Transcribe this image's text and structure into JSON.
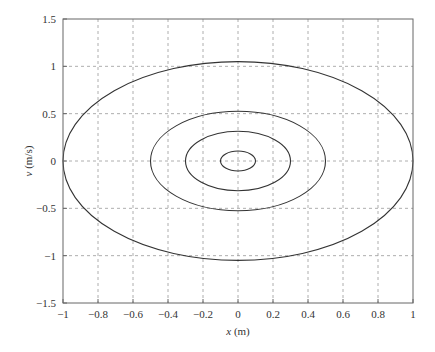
{
  "chart_data": {
    "type": "line",
    "title": "",
    "xlabel": "x (m)",
    "ylabel": "v (m/s)",
    "xlim": [
      -1,
      1
    ],
    "ylim": [
      -1.5,
      1.5
    ],
    "grid": true,
    "legend": null,
    "x_ticks": [
      -1,
      -0.8,
      -0.6,
      -0.4,
      -0.2,
      0,
      0.2,
      0.4,
      0.6,
      0.8,
      1
    ],
    "x_tick_labels": [
      "−1",
      "−0.8",
      "−0.6",
      "−0.4",
      "−0.2",
      "0",
      "0.2",
      "0.4",
      "0.6",
      "0.8",
      "1"
    ],
    "y_ticks": [
      -1.5,
      -1,
      -0.5,
      0,
      0.5,
      1,
      1.5
    ],
    "y_tick_labels": [
      "−1.5",
      "−1",
      "−0.5",
      "0",
      "0.5",
      "1",
      "1.5"
    ],
    "series": [
      {
        "name": "orbit-1",
        "shape": "ellipse",
        "center": [
          0,
          0
        ],
        "x_radius": 0.1,
        "v_radius": 0.105
      },
      {
        "name": "orbit-2",
        "shape": "ellipse",
        "center": [
          0,
          0
        ],
        "x_radius": 0.3,
        "v_radius": 0.315
      },
      {
        "name": "orbit-3",
        "shape": "ellipse",
        "center": [
          0,
          0
        ],
        "x_radius": 0.5,
        "v_radius": 0.525
      },
      {
        "name": "orbit-4",
        "shape": "ellipse",
        "center": [
          0,
          0
        ],
        "x_radius": 1.0,
        "v_radius": 1.05
      }
    ],
    "colors": {
      "line": "#333333",
      "grid": "#999999",
      "axes": "#666666"
    }
  },
  "plot_area": {
    "left": 63,
    "right": 413,
    "top": 19,
    "bottom": 303
  }
}
